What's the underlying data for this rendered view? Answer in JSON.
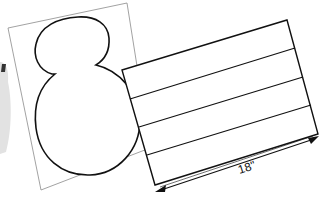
{
  "diagram": {
    "colors": {
      "background": "#ffffff",
      "paper_outline": "#8a8a8a",
      "shape_stroke": "#111111",
      "ghost_shape": "#dcdcdc"
    },
    "back_paper": {
      "description": "tilted sheet with snowman / figure-eight outline",
      "points": [
        [
          8,
          28
        ],
        [
          127,
          3
        ],
        [
          150,
          148
        ],
        [
          41,
          190
        ]
      ]
    },
    "striped_panel": {
      "corners": [
        [
          122,
          70
        ],
        [
          287,
          20
        ],
        [
          318,
          134
        ],
        [
          155,
          185
        ]
      ],
      "stripe_count": 4
    },
    "dimension": {
      "label": "18\"",
      "from": [
        157,
        191
      ],
      "to": [
        318,
        137
      ]
    }
  }
}
